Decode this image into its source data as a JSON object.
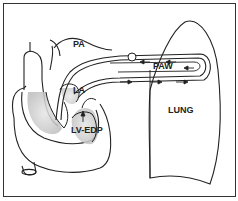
{
  "diagram": {
    "labels": {
      "pa": "PA",
      "paw": "PAW",
      "la": "LA",
      "lv_edp": "LV-EDP",
      "lung": "LUNG"
    },
    "colors": {
      "stroke": "#222222",
      "shade": "#d4d4d4",
      "background": "#ffffff",
      "border": "#333333"
    }
  }
}
